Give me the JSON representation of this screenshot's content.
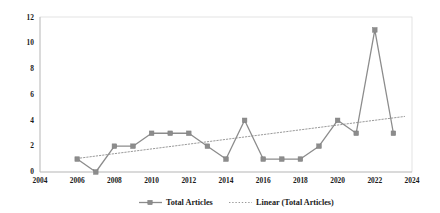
{
  "chart_data": {
    "type": "line",
    "title": "",
    "xlabel": "",
    "ylabel": "",
    "xlim": [
      2004,
      2024
    ],
    "ylim": [
      0,
      12
    ],
    "grid": false,
    "legend_position": "bottom",
    "x_ticks": [
      "2004",
      "2006",
      "2008",
      "2010",
      "2012",
      "2014",
      "2016",
      "2018",
      "2020",
      "2022",
      "2024"
    ],
    "y_ticks": [
      "0",
      "2",
      "4",
      "6",
      "8",
      "10",
      "12"
    ],
    "x": [
      2006,
      2007,
      2008,
      2009,
      2010,
      2011,
      2012,
      2013,
      2014,
      2015,
      2016,
      2017,
      2018,
      2019,
      2020,
      2021,
      2022,
      2023
    ],
    "series": [
      {
        "name": "Total Articles",
        "type": "line-marker",
        "color": "#8c8c8c",
        "values": [
          1,
          0,
          2,
          2,
          3,
          3,
          3,
          2,
          1,
          4,
          1,
          1,
          1,
          2,
          4,
          3,
          11,
          3
        ]
      },
      {
        "name": "Linear (Total Articles)",
        "type": "trendline-dotted",
        "color": "#9a9a9a",
        "x_endpoints": [
          2006,
          2023.6
        ],
        "y_endpoints": [
          1.05,
          4.3
        ]
      }
    ],
    "legend": [
      {
        "label": "Total Articles",
        "marker": "square-line",
        "color": "#8c8c8c"
      },
      {
        "label": "Linear (Total Articles)",
        "marker": "dotted-line",
        "color": "#9a9a9a"
      }
    ]
  }
}
